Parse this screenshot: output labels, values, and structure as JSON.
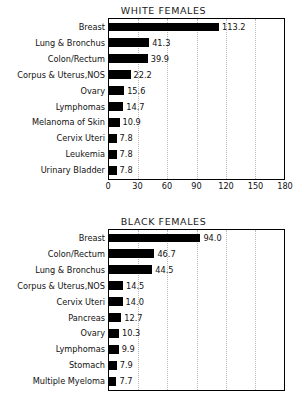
{
  "figure": {
    "background_color": "#ffffff",
    "bar_color": "#000000",
    "gridline_color": "#b9b9b9",
    "axis_color": "#000000"
  },
  "chart_data": [
    {
      "type": "bar",
      "orientation": "horizontal",
      "title": "WHITE FEMALES",
      "xlabel": "",
      "ylabel": "",
      "xlim": [
        0,
        180
      ],
      "ylim": null,
      "grid": true,
      "grid_axis": "x",
      "legend": false,
      "categories": [
        "Breast",
        "Lung & Bronchus",
        "Colon/Rectum",
        "Corpus & Uterus,NOS",
        "Ovary",
        "Lymphomas",
        "Melanoma of Skin",
        "Cervix Uteri",
        "Leukemia",
        "Urinary Bladder"
      ],
      "values": [
        113.2,
        41.3,
        39.9,
        22.2,
        15.6,
        14.7,
        10.9,
        7.8,
        7.8,
        7.8
      ],
      "value_labels": [
        "113.2",
        "41.3",
        "39.9",
        "22.2",
        "15.6",
        "14.7",
        "10.9",
        "7.8",
        "7.8",
        "7.8"
      ],
      "xticks": [
        0,
        30,
        60,
        90,
        120,
        150,
        180
      ],
      "xtick_labels": [
        "0",
        "30",
        "60",
        "90",
        "120",
        "150",
        "180"
      ],
      "xaxis_visible": true
    },
    {
      "type": "bar",
      "orientation": "horizontal",
      "title": "BLACK FEMALES",
      "xlabel": "",
      "ylabel": "",
      "xlim": [
        0,
        180
      ],
      "ylim": null,
      "grid": true,
      "grid_axis": "x",
      "legend": false,
      "categories": [
        "Breast",
        "Colon/Rectum",
        "Lung & Bronchus",
        "Corpus & Uterus,NOS",
        "Cervix Uteri",
        "Pancreas",
        "Ovary",
        "Lymphomas",
        "Stomach",
        "Multiple Myeloma"
      ],
      "values": [
        94.0,
        46.7,
        44.5,
        14.5,
        14.0,
        12.7,
        10.3,
        9.9,
        7.9,
        7.7
      ],
      "value_labels": [
        "94.0",
        "46.7",
        "44.5",
        "14.5",
        "14.0",
        "12.7",
        "10.3",
        "9.9",
        "7.9",
        "7.7"
      ],
      "xticks": [
        0,
        30,
        60,
        90,
        120,
        150,
        180
      ],
      "xtick_labels": [
        "0",
        "30",
        "60",
        "90",
        "120",
        "150",
        "180"
      ],
      "xaxis_visible": false
    }
  ]
}
